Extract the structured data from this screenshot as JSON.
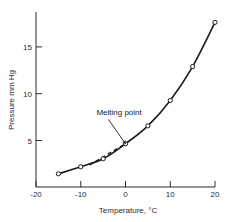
{
  "chart_data": {
    "type": "line",
    "title": "",
    "xlabel": "Temperature,  °C",
    "ylabel": "Pressure   mm Hg",
    "xlim": [
      -20,
      20
    ],
    "ylim": [
      0,
      18.6
    ],
    "grid": false,
    "legend": null,
    "xticks": [
      -20,
      -10,
      0,
      10,
      20
    ],
    "xtick_labels": [
      "-20",
      "-10",
      "0",
      "10",
      "20"
    ],
    "yticks": [
      5,
      10,
      15
    ],
    "ytick_labels": [
      "5",
      "10",
      "15"
    ],
    "series": [
      {
        "name": "Vapor pressure of water",
        "marker": "open-circle",
        "x": [
          -15,
          -10,
          -5,
          0,
          5,
          10,
          15,
          20
        ],
        "values": [
          1.4,
          2.15,
          3.0,
          4.6,
          6.5,
          9.2,
          12.8,
          17.5
        ]
      }
    ],
    "extrapolation_line": {
      "name": "Sublimation curve extrapolation",
      "style": "dashed",
      "x": [
        -8,
        0
      ],
      "values": [
        2.35,
        4.6
      ]
    },
    "annotations": [
      {
        "text": "Melting point",
        "point_x": 0,
        "point_y": 4.6,
        "label_x": -6.5,
        "label_y": 7.6
      }
    ]
  }
}
